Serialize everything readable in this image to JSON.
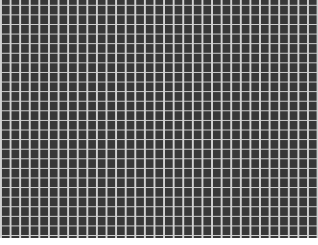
{
  "image": {
    "description": "Uniform grid pattern of dark gray square cells separated by light gray lines",
    "colors": {
      "cell": "#383838",
      "line": "#d2d2d2",
      "margin": "#ffffff"
    },
    "grid": {
      "approx_columns": 33,
      "approx_rows": 25,
      "cell_pitch_px": 9.6
    }
  }
}
